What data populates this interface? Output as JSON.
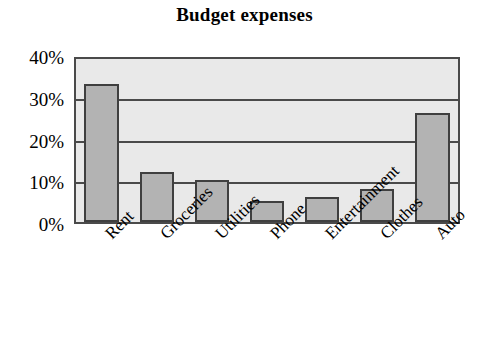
{
  "chart_data": {
    "type": "bar",
    "title": "Budget expenses",
    "xlabel": "",
    "ylabel": "",
    "categories": [
      "Rent",
      "Groceries",
      "Utilities",
      "Phone",
      "Entertainment",
      "Clothes",
      "Auto"
    ],
    "values": [
      33,
      12,
      10,
      5,
      6,
      8,
      26
    ],
    "ylim": [
      0,
      40
    ],
    "ytick_values": [
      0,
      10,
      20,
      30,
      40
    ],
    "ytick_labels": [
      "0%",
      "10%",
      "20%",
      "30%",
      "40%"
    ],
    "grid": true,
    "legend": "none",
    "value_unit": "%",
    "xtick_rotation_deg": -45,
    "colors": {
      "bar_fill": "#b3b3b3",
      "bar_outline": "#3f3f3f",
      "plot_background": "#e9e9e9",
      "axis_line": "#4a4a4a",
      "text": "#000000",
      "figure_background": "#ffffff"
    }
  }
}
